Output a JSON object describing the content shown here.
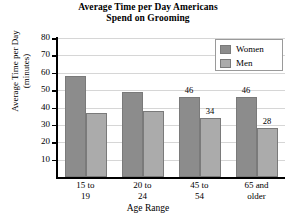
{
  "chart_data": {
    "type": "bar",
    "title": "Average Time per Day Americans Spend on Grooming",
    "title_line1": "Average Time per Day Americans",
    "title_line2": "Spend on Grooming",
    "xlabel": "Age Range",
    "ylabel": "Average Time per Day (minutes)",
    "ylabel_line1": "Average Time per Day",
    "ylabel_line2": "(minutes)",
    "categories": [
      "15 to 19",
      "20 to 24",
      "45 to 54",
      "65 and older"
    ],
    "category_lines": [
      [
        "15 to",
        "19"
      ],
      [
        "20 to",
        "24"
      ],
      [
        "45 to",
        "54"
      ],
      [
        "65 and",
        "older"
      ]
    ],
    "series": [
      {
        "name": "Women",
        "color": "#8c8c8c",
        "values": [
          58,
          49,
          46,
          46
        ],
        "labels": [
          "",
          "",
          "46",
          "46"
        ]
      },
      {
        "name": "Men",
        "color": "#ababab",
        "values": [
          37,
          38,
          34,
          28
        ],
        "labels": [
          "",
          "",
          "34",
          "28"
        ]
      }
    ],
    "ylim": [
      0,
      80
    ],
    "yticks": [
      10,
      20,
      30,
      40,
      50,
      60,
      70,
      80
    ],
    "ytick_labels": [
      "10",
      "20",
      "30",
      "40",
      "50",
      "60",
      "70",
      "80"
    ],
    "grid": true,
    "legend_position": "top-right",
    "legend": [
      "Women",
      "Men"
    ]
  }
}
